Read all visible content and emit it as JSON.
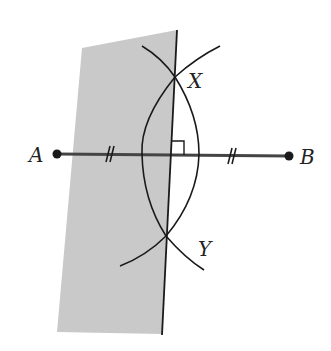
{
  "diagram": {
    "type": "perpendicular-bisector-construction",
    "colors": {
      "plane_fill": "#c9c9c9",
      "line": "#1a1a1a",
      "segment": "#444444",
      "point": "#1a1a1a",
      "background": "#ffffff"
    },
    "points": {
      "A": {
        "label": "A",
        "x": 57,
        "y": 154
      },
      "B": {
        "label": "B",
        "x": 289,
        "y": 156
      },
      "X": {
        "label": "X",
        "x": 175,
        "y": 77
      },
      "Y": {
        "label": "Y",
        "x": 166,
        "y": 236
      }
    },
    "labels": {
      "A": "A",
      "B": "B",
      "X": "X",
      "Y": "Y"
    },
    "segment_AB": {
      "from": "A",
      "to": "B",
      "congruence_marks": "double tick (//) on each half"
    },
    "perpendicular_line": {
      "through": [
        "X",
        "Y"
      ],
      "right_angle_marker": true
    },
    "plane": {
      "shaded": true,
      "corners": [
        [
          82,
          48
        ],
        [
          176,
          30
        ],
        [
          162,
          334
        ],
        [
          57,
          332
        ]
      ]
    }
  }
}
